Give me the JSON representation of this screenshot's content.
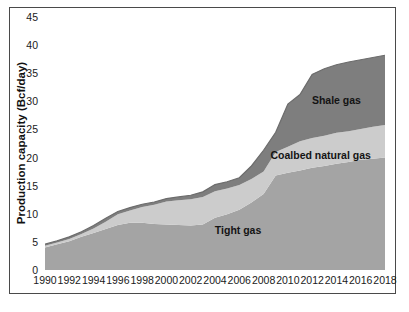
{
  "chart_data": {
    "type": "area",
    "stacked": true,
    "title": "",
    "ylabel": "Production capacity (Bcf/day)",
    "xlabel": "",
    "ylim": [
      0,
      45
    ],
    "grid": false,
    "legend": "none (labels drawn inside areas)",
    "x": [
      1990,
      1991,
      1992,
      1993,
      1994,
      1995,
      1996,
      1997,
      1998,
      1999,
      2000,
      2001,
      2002,
      2003,
      2004,
      2005,
      2006,
      2007,
      2008,
      2009,
      2010,
      2011,
      2012,
      2013,
      2014,
      2015,
      2016,
      2017,
      2018
    ],
    "series": [
      {
        "name": "Tight gas",
        "color": "#a4a4a4",
        "values": [
          4.0,
          4.6,
          5.1,
          5.9,
          6.6,
          7.3,
          8.0,
          8.4,
          8.4,
          8.2,
          8.1,
          8.0,
          7.9,
          8.1,
          9.3,
          9.9,
          10.7,
          12.0,
          13.5,
          16.8,
          17.3,
          17.7,
          18.2,
          18.5,
          18.9,
          19.2,
          19.6,
          19.8,
          20.0
        ]
      },
      {
        "name": "Coalbed natural gas",
        "color": "#cccccc",
        "values": [
          0.3,
          0.3,
          0.4,
          0.5,
          0.8,
          1.3,
          1.9,
          2.2,
          2.8,
          3.4,
          4.1,
          4.4,
          4.7,
          4.9,
          4.7,
          4.6,
          4.4,
          4.2,
          4.0,
          4.2,
          4.6,
          5.2,
          5.3,
          5.4,
          5.5,
          5.5,
          5.5,
          5.7,
          5.8
        ]
      },
      {
        "name": "Shale gas",
        "color": "#7e7e7e",
        "values": [
          0.3,
          0.3,
          0.4,
          0.4,
          0.5,
          0.6,
          0.5,
          0.5,
          0.5,
          0.5,
          0.5,
          0.6,
          0.7,
          0.9,
          1.2,
          1.2,
          1.3,
          2.3,
          3.8,
          3.5,
          7.6,
          8.3,
          11.3,
          11.9,
          12.1,
          12.3,
          12.3,
          12.3,
          12.4
        ]
      }
    ],
    "totals_hint": [
      4.6,
      5.2,
      5.9,
      6.8,
      7.9,
      9.2,
      10.4,
      11.1,
      11.7,
      12.1,
      12.7,
      13.0,
      13.3,
      13.9,
      15.2,
      15.7,
      16.4,
      18.5,
      21.3,
      24.5,
      29.5,
      31.2,
      34.8,
      35.8,
      36.5,
      37.0,
      37.4,
      37.8,
      38.2
    ],
    "y_tick_labels": [
      "0",
      "5",
      "10",
      "15",
      "20",
      "25",
      "30",
      "35",
      "40",
      "45"
    ],
    "x_tick_labels": [
      "1990",
      "1992",
      "1994",
      "1996",
      "1998",
      "2000",
      "2002",
      "2004",
      "2006",
      "2008",
      "2010",
      "2012",
      "2014",
      "2016",
      "2018"
    ],
    "annotations": [
      {
        "text": "Shale gas",
        "x": 2014.0,
        "y": 30.2
      },
      {
        "text": "Coalbed natural gas",
        "x": 2012.7,
        "y": 20.4
      },
      {
        "text": "Tight gas",
        "x": 2005.9,
        "y": 7.1
      }
    ],
    "edge_stroke_color": "#6c6c6c"
  }
}
